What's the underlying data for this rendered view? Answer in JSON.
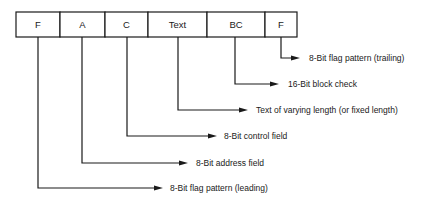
{
  "diagram": {
    "frame": {
      "x": 16,
      "y": 12,
      "height": 25,
      "fields": [
        {
          "id": "flag-leading",
          "label": "F",
          "x0": 16,
          "x1": 60
        },
        {
          "id": "address",
          "label": "A",
          "x0": 60,
          "x1": 105
        },
        {
          "id": "control",
          "label": "C",
          "x0": 105,
          "x1": 148
        },
        {
          "id": "text",
          "label": "Text",
          "x0": 148,
          "x1": 207
        },
        {
          "id": "block-check",
          "label": "BC",
          "x0": 207,
          "x1": 265
        },
        {
          "id": "flag-trailing",
          "label": "F",
          "x0": 265,
          "x1": 297
        }
      ]
    },
    "callouts": [
      {
        "field": "flag-trailing",
        "text": "8-Bit flag pattern (trailing)",
        "drop_x": 281,
        "y": 58,
        "arrow_tip_x": 300,
        "text_x": 309
      },
      {
        "field": "block-check",
        "text": "16-Bit block check",
        "drop_x": 235,
        "y": 84,
        "arrow_tip_x": 279,
        "text_x": 288
      },
      {
        "field": "text",
        "text": "Text of varying length (or fixed length)",
        "drop_x": 178,
        "y": 110,
        "arrow_tip_x": 248,
        "text_x": 256
      },
      {
        "field": "control",
        "text": "8-Bit control field",
        "drop_x": 127,
        "y": 136,
        "arrow_tip_x": 217,
        "text_x": 224
      },
      {
        "field": "address",
        "text": "8-Bit address field",
        "drop_x": 82,
        "y": 163,
        "arrow_tip_x": 188,
        "text_x": 196
      },
      {
        "field": "flag-leading",
        "text": "8-Bit flag pattern (leading)",
        "drop_x": 38,
        "y": 188,
        "arrow_tip_x": 163,
        "text_x": 170
      }
    ]
  }
}
